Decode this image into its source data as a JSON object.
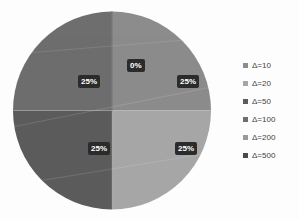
{
  "chart_data": {
    "type": "pie",
    "title": "",
    "categories": [
      "Δ=10",
      "Δ=20",
      "Δ=50",
      "Δ=100",
      "Δ=200",
      "Δ=500"
    ],
    "values": [
      25,
      25,
      25,
      25,
      0,
      0
    ],
    "value_labels": [
      "25%",
      "25%",
      "25%",
      "25%",
      "0%",
      ""
    ],
    "colors": [
      "#8c8c8c",
      "#a6a6a6",
      "#5b5b5b",
      "#6e6e6e",
      "#9a9a9a",
      "#4a4a4a"
    ],
    "legend_position": "right",
    "grid": false,
    "start_angle_deg": 0,
    "slices": [
      {
        "label": "Δ=10",
        "percent_label": "25%",
        "value": 25,
        "color": "#8c8c8c",
        "quadrant": "top-right"
      },
      {
        "label": "Δ=20",
        "percent_label": "25%",
        "value": 25,
        "color": "#a6a6a6",
        "quadrant": "bottom-right"
      },
      {
        "label": "Δ=50",
        "percent_label": "25%",
        "value": 25,
        "color": "#5b5b5b",
        "quadrant": "bottom-left"
      },
      {
        "label": "Δ=100",
        "percent_label": "25%",
        "value": 25,
        "color": "#6e6e6e",
        "quadrant": "top-left"
      },
      {
        "label": "Δ=200",
        "percent_label": "0%",
        "value": 0,
        "color": "#9a9a9a",
        "quadrant": "top-center"
      },
      {
        "label": "Δ=500",
        "percent_label": "",
        "value": 0,
        "color": "#4a4a4a",
        "quadrant": "top-center"
      }
    ]
  },
  "labels": {
    "q_top_right": "25%",
    "q_top_left": "25%",
    "q_bottom_left": "25%",
    "q_bottom_right": "25%",
    "zero": "0%"
  },
  "legend": {
    "items": [
      {
        "label": "Δ=10",
        "color": "#8c8c8c"
      },
      {
        "label": "Δ=20",
        "color": "#a6a6a6"
      },
      {
        "label": "Δ=50",
        "color": "#5b5b5b"
      },
      {
        "label": "Δ=100",
        "color": "#6e6e6e"
      },
      {
        "label": "Δ=200",
        "color": "#9a9a9a"
      },
      {
        "label": "Δ=500",
        "color": "#4a4a4a"
      }
    ]
  }
}
